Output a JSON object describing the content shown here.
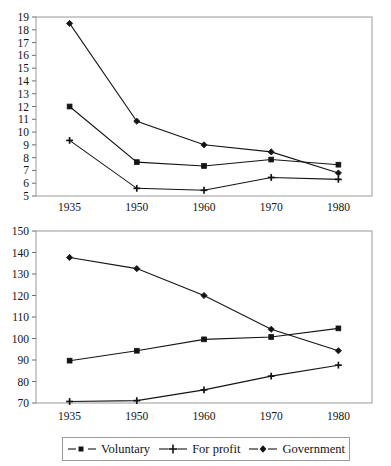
{
  "figure": {
    "series_names": [
      "Voluntary",
      "For profit",
      "Government"
    ],
    "markers": [
      "square-marker",
      "plus-marker",
      "diamond-marker"
    ],
    "line_color": "#141414",
    "frame_color": "#9a9a9a"
  },
  "legend": {
    "position": "bottom",
    "items": [
      {
        "label": "Voluntary",
        "marker": "square-marker"
      },
      {
        "label": "For profit",
        "marker": "plus-marker"
      },
      {
        "label": "Government",
        "marker": "diamond-marker"
      }
    ]
  },
  "chart_data": [
    {
      "type": "line",
      "title": "",
      "xlabel": "",
      "ylabel": "",
      "categories": [
        "1935",
        "1950",
        "1960",
        "1970",
        "1980"
      ],
      "x": [
        1935,
        1950,
        1960,
        1970,
        1980
      ],
      "ylim": [
        5,
        19
      ],
      "yticks": [
        5,
        6,
        7,
        8,
        9,
        10,
        11,
        12,
        13,
        14,
        15,
        16,
        17,
        18,
        19
      ],
      "ytick_labels": [
        "5",
        "6",
        "7",
        "8",
        "9",
        "10",
        "11",
        "12",
        "13",
        "14",
        "15",
        "16",
        "17",
        "18",
        "19"
      ],
      "grid": false,
      "legend_position": "none",
      "series": [
        {
          "name": "Voluntary",
          "marker": "square-marker",
          "values": [
            12.0,
            7.65,
            7.35,
            7.85,
            7.45
          ]
        },
        {
          "name": "For profit",
          "marker": "plus-marker",
          "values": [
            9.35,
            5.6,
            5.45,
            6.45,
            6.3
          ]
        },
        {
          "name": "Government",
          "marker": "diamond-marker",
          "values": [
            18.5,
            10.85,
            9.0,
            8.45,
            6.8
          ]
        }
      ]
    },
    {
      "type": "line",
      "title": "",
      "xlabel": "",
      "ylabel": "",
      "categories": [
        "1935",
        "1950",
        "1960",
        "1970",
        "1980"
      ],
      "x": [
        1935,
        1950,
        1960,
        1970,
        1980
      ],
      "ylim": [
        70,
        150
      ],
      "yticks": [
        70,
        80,
        90,
        100,
        110,
        120,
        130,
        140,
        150
      ],
      "ytick_labels": [
        "70",
        "80",
        "90",
        "100",
        "110",
        "120",
        "130",
        "140",
        "150"
      ],
      "grid": false,
      "legend_position": "bottom",
      "series": [
        {
          "name": "Voluntary",
          "marker": "square-marker",
          "values": [
            89.7,
            94.3,
            99.6,
            100.7,
            104.7
          ]
        },
        {
          "name": "For profit",
          "marker": "plus-marker",
          "values": [
            70.7,
            71.1,
            76.1,
            82.5,
            87.6
          ]
        },
        {
          "name": "Government",
          "marker": "diamond-marker",
          "values": [
            137.7,
            132.5,
            120.0,
            104.3,
            94.3
          ]
        }
      ]
    }
  ]
}
